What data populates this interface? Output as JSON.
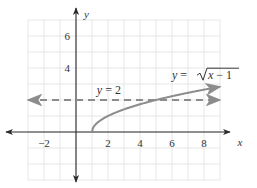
{
  "chart_data": {
    "type": "line",
    "title": "",
    "xlabel": "x",
    "ylabel": "y",
    "xlim": [
      -3,
      9
    ],
    "ylim": [
      -3,
      7
    ],
    "grid": true,
    "x_ticks": [
      {
        "value": -2,
        "label": "−2"
      },
      {
        "value": 2,
        "label": "2"
      },
      {
        "value": 4,
        "label": "4"
      },
      {
        "value": 6,
        "label": "6"
      },
      {
        "value": 8,
        "label": "8"
      }
    ],
    "y_ticks": [
      {
        "value": 4,
        "label": "4"
      },
      {
        "value": 6,
        "label": "6"
      }
    ],
    "series": [
      {
        "name": "y = √(x − 1)",
        "function": "sqrt(x-1)",
        "domain": [
          1,
          9
        ],
        "style": "solid",
        "color": "#8c8c8c",
        "arrow_end": true,
        "points": [
          [
            1,
            0
          ],
          [
            1.25,
            0.5
          ],
          [
            2,
            1
          ],
          [
            3,
            1.414
          ],
          [
            4,
            1.732
          ],
          [
            5,
            2
          ],
          [
            6,
            2.236
          ],
          [
            7,
            2.449
          ],
          [
            8,
            2.646
          ],
          [
            9,
            2.828
          ]
        ]
      },
      {
        "name": "y = 2",
        "function": "2",
        "domain": [
          -3,
          9
        ],
        "style": "dashed",
        "color": "#8c8c8c",
        "arrow_start": true,
        "arrow_end": true,
        "points": [
          [
            -3,
            2
          ],
          [
            9,
            2
          ]
        ]
      }
    ],
    "annotations": [
      {
        "text_var": "y",
        "text_eq": " = 2",
        "series": "y = 2",
        "at": [
          1.3,
          2.35
        ]
      },
      {
        "text_var": "y",
        "text_eq": " = ",
        "radicand_var": "x",
        "radicand_rest": " − 1",
        "series": "y = √(x − 1)",
        "at": [
          6.0,
          3.3
        ]
      }
    ]
  }
}
